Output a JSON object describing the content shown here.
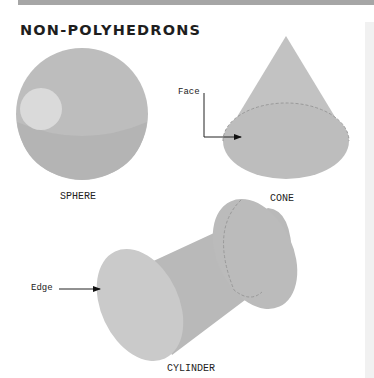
{
  "title": "NON-POLYHEDRONS",
  "shapes": [
    {
      "name": "SPHERE",
      "caption": "SPHERE"
    },
    {
      "name": "CONE",
      "caption": "CONE",
      "annotation": "Face"
    },
    {
      "name": "CYLINDER",
      "caption": "CYLINDER",
      "annotation": "Edge"
    }
  ],
  "colors": {
    "shape_fill": "#b9b9b9",
    "shape_face": "#c6c6c6",
    "highlight": "#dcdcdc",
    "band": "#a6a6a6"
  }
}
